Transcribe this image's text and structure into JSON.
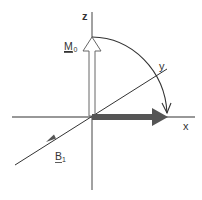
{
  "diagram": {
    "title": "",
    "labels": {
      "z_axis": "z",
      "y_axis": "y",
      "x_axis": "x",
      "m0_main": "M",
      "m0_sub": "0",
      "b1_main": "B",
      "b1_sub": "1"
    },
    "colors": {
      "axis": "#333333",
      "thick_arrow": "#555555",
      "hollow_arrow_stroke": "#555555",
      "arc": "#333333",
      "b1_line": "#444444"
    },
    "elements": [
      {
        "id": "x-axis",
        "type": "line",
        "description": "horizontal axis"
      },
      {
        "id": "z-axis",
        "type": "line",
        "description": "vertical axis"
      },
      {
        "id": "y-axis",
        "type": "line",
        "description": "diagonal axis into depth"
      },
      {
        "id": "m0-vector",
        "type": "hollow-arrow",
        "direction": "+z",
        "label": "M0"
      },
      {
        "id": "rotated-vector",
        "type": "solid-thick-arrow",
        "direction": "+x"
      },
      {
        "id": "rotation-arc",
        "type": "curved-arrow",
        "from": "+z",
        "to": "+x"
      },
      {
        "id": "b1-vector",
        "type": "arrow",
        "direction": "-y",
        "label": "B1"
      }
    ]
  }
}
